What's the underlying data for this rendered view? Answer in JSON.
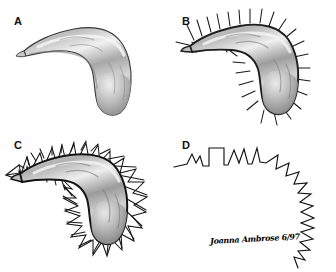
{
  "figure": {
    "background_color": "#ffffff",
    "ink_color": "#1a1a1a",
    "body_outline_color": "#242424",
    "highlight_color": "#f2f2f2",
    "midtone_color": "#9a9a9a",
    "shadow_color": "#5c5c5c"
  },
  "panels": [
    {
      "id": "a",
      "label": "A",
      "caption": "Plain shaded body, no appendages",
      "label_x": 14,
      "label_y": 16
    },
    {
      "id": "b",
      "label": "B",
      "caption": "Body with radiating straight spines",
      "label_x": 14,
      "label_y": 16
    },
    {
      "id": "c",
      "label": "C",
      "caption": "Body with spines and angular connecting envelope",
      "label_x": 14,
      "label_y": 14
    },
    {
      "id": "d",
      "label": "D",
      "caption": "Angular envelope outline only, body removed",
      "label_x": 14,
      "label_y": 14
    }
  ],
  "signature": {
    "text": "Joanna Ambrose 6/97",
    "artist": "Joanna Ambrose",
    "date": "6/97"
  }
}
